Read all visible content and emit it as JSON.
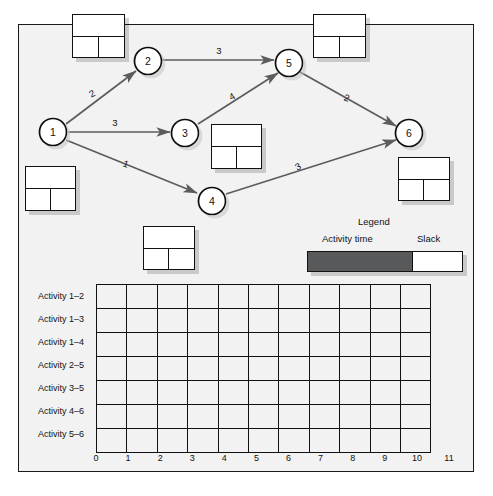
{
  "diagram": {
    "type": "activity-on-arrow-network",
    "nodes": [
      {
        "id": "1",
        "label": "1",
        "cx": 53,
        "cy": 132
      },
      {
        "id": "2",
        "label": "2",
        "cx": 148,
        "cy": 61
      },
      {
        "id": "3",
        "label": "3",
        "cx": 185,
        "cy": 133
      },
      {
        "id": "4",
        "label": "4",
        "cx": 212,
        "cy": 201
      },
      {
        "id": "5",
        "label": "5",
        "cx": 289,
        "cy": 63
      },
      {
        "id": "6",
        "label": "6",
        "cx": 409,
        "cy": 133
      }
    ],
    "edges": [
      {
        "from": "1",
        "to": "2",
        "duration": "2"
      },
      {
        "from": "1",
        "to": "3",
        "duration": "3"
      },
      {
        "from": "1",
        "to": "4",
        "duration": "1"
      },
      {
        "from": "2",
        "to": "5",
        "duration": "3"
      },
      {
        "from": "3",
        "to": "5",
        "duration": "4"
      },
      {
        "from": "4",
        "to": "6",
        "duration": "3"
      },
      {
        "from": "5",
        "to": "6",
        "duration": "2"
      }
    ],
    "activity_boxes": [
      {
        "name": "box-near-node-2",
        "x": 72,
        "y": 14,
        "w": 53,
        "h": 44
      },
      {
        "name": "box-near-node-5",
        "x": 313,
        "y": 14,
        "w": 53,
        "h": 44
      },
      {
        "name": "box-near-node-3",
        "x": 211,
        "y": 124,
        "w": 51,
        "h": 45
      },
      {
        "name": "box-near-node-6",
        "x": 398,
        "y": 157,
        "w": 52,
        "h": 44
      },
      {
        "name": "box-near-node-1",
        "x": 25,
        "y": 166,
        "w": 51,
        "h": 45
      },
      {
        "name": "box-near-node-4",
        "x": 143,
        "y": 226,
        "w": 52,
        "h": 44
      }
    ]
  },
  "legend": {
    "title": "Legend",
    "activity_time_label": "Activity time",
    "slack_label": "Slack",
    "activity_time_color": "#58595b",
    "slack_color": "#ffffff"
  },
  "chart_data": {
    "type": "bar",
    "title": "",
    "xlabel": "",
    "ylabel": "",
    "categories": [
      "Activity 1–2",
      "Activity 1–3",
      "Activity 1–4",
      "Activity 2–5",
      "Activity 3–5",
      "Activity 4–6",
      "Activity 5–6"
    ],
    "values": [
      null,
      null,
      null,
      null,
      null,
      null,
      null
    ],
    "xticks": [
      "0",
      "1",
      "2",
      "3",
      "4",
      "5",
      "6",
      "7",
      "8",
      "9",
      "10",
      "11"
    ],
    "xlim": [
      0,
      11
    ],
    "grid": true,
    "legend_position": "above-right",
    "note": "blank Gantt grid — no bars drawn"
  }
}
